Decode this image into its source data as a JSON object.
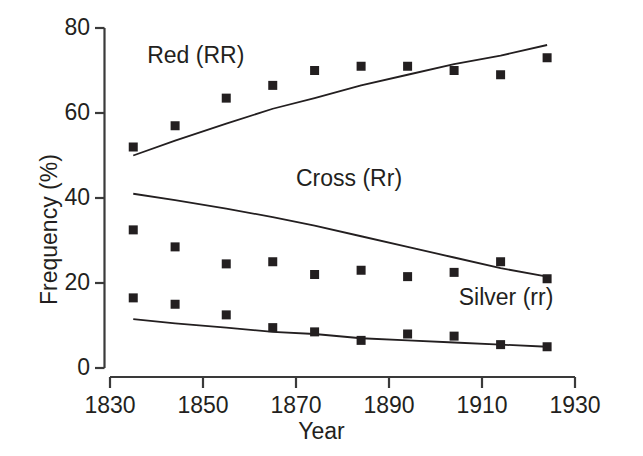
{
  "chart_data": {
    "type": "scatter",
    "title": "",
    "xlabel": "Year",
    "ylabel": "Frequency (%)",
    "xlim": [
      1830,
      1930
    ],
    "ylim": [
      0,
      80
    ],
    "xticks": [
      1830,
      1850,
      1870,
      1890,
      1910,
      1930
    ],
    "xtick_labels": [
      "1830",
      "1850",
      "1870",
      "1890",
      "1910",
      "1930"
    ],
    "yticks": [
      0,
      20,
      40,
      60,
      80
    ],
    "ytick_labels": [
      "0",
      "20",
      "40",
      "60",
      "80"
    ],
    "grid": false,
    "legend_position": "inline-annotations",
    "x": [
      1835,
      1844,
      1855,
      1865,
      1874,
      1884,
      1894,
      1904,
      1914,
      1924
    ],
    "series": [
      {
        "name": "Red (RR)",
        "marker": "filled-square",
        "color": "#231f20",
        "values": [
          52,
          57,
          63.5,
          66.5,
          70,
          71,
          71,
          70,
          69,
          73
        ],
        "fit_line": {
          "x": [
            1835,
            1844,
            1855,
            1865,
            1874,
            1884,
            1894,
            1904,
            1914,
            1924
          ],
          "y": [
            50,
            53.5,
            57.5,
            61,
            63.5,
            66.5,
            69,
            71.5,
            73.5,
            76
          ]
        },
        "label_text": "Red (RR)",
        "label_x": 1838,
        "label_y": 73.5
      },
      {
        "name": "Cross (Rr)",
        "marker": "filled-square",
        "color": "#231f20",
        "values": [
          32.5,
          28.5,
          24.5,
          25,
          22,
          23,
          21.5,
          22.5,
          25,
          21
        ],
        "fit_line": {
          "x": [
            1835,
            1844,
            1855,
            1865,
            1874,
            1884,
            1894,
            1904,
            1914,
            1924
          ],
          "y": [
            41,
            39.5,
            37.5,
            35.5,
            33.5,
            31,
            28.5,
            26,
            23.5,
            21.5
          ]
        },
        "label_text": "Cross (Rr)",
        "label_x": 1870,
        "label_y": 44.5
      },
      {
        "name": "Silver (rr)",
        "marker": "filled-square",
        "color": "#231f20",
        "values": [
          16.5,
          15,
          12.5,
          9.5,
          8.5,
          6.5,
          8,
          7.5,
          5.5,
          5
        ],
        "fit_line": {
          "x": [
            1835,
            1844,
            1855,
            1865,
            1874,
            1884,
            1894,
            1904,
            1914,
            1924
          ],
          "y": [
            11.5,
            10.5,
            9.5,
            8.5,
            8,
            7,
            6.5,
            6,
            5.5,
            5
          ]
        },
        "label_text": "Silver (rr)",
        "label_x": 1905,
        "label_y": 16.5
      }
    ]
  },
  "axis": {
    "y_title": "Frequency (%)",
    "x_title": "Year"
  }
}
